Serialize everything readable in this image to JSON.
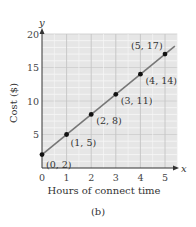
{
  "chart_data": {
    "type": "line",
    "title": "",
    "caption": "(b)",
    "xlabel": "Hours of connect time",
    "ylabel": "Cost ($)",
    "x_axis_letter": "x",
    "y_axis_letter": "y",
    "xlim": [
      0,
      5.5
    ],
    "ylim": [
      0,
      20
    ],
    "xticks": [
      "0",
      "1",
      "2",
      "3",
      "4",
      "5"
    ],
    "yticks": [
      "5",
      "10",
      "15",
      "20"
    ],
    "grid": true,
    "series": [
      {
        "name": "Cost",
        "x": [
          0,
          1,
          2,
          3,
          4,
          5
        ],
        "y": [
          2,
          5,
          8,
          11,
          14,
          17
        ],
        "point_labels": [
          "(0, 2)",
          "(1, 5)",
          "(2, 8)",
          "(3, 11)",
          "(4, 14)",
          "(5, 17)"
        ]
      }
    ],
    "colors": {
      "grid_background": "#e6e6e6",
      "grid_line": "#f7f7f7",
      "line": "#777777",
      "point": "#111111",
      "axis": "#333333"
    }
  }
}
